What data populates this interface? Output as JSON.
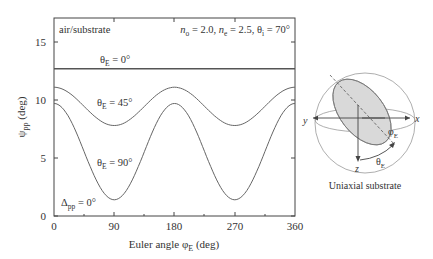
{
  "chart_data": {
    "type": "line",
    "title": "",
    "xlabel": "Euler angle φE (deg)",
    "ylabel": "ψpp (deg)",
    "xlim": [
      0,
      360
    ],
    "ylim": [
      0,
      17
    ],
    "xticks": [
      0,
      90,
      180,
      270,
      360
    ],
    "yticks": [
      0,
      5,
      10,
      15
    ],
    "grid": false,
    "annotations": {
      "medium": "air/substrate",
      "params": "no = 2.0, ne = 2.5, θi = 70°",
      "delta": "Δpp = 0°"
    },
    "x": [
      0,
      45,
      90,
      135,
      180,
      225,
      270,
      315,
      360
    ],
    "series": [
      {
        "name": "θE = 0°",
        "values": [
          12.7,
          12.7,
          12.7,
          12.7,
          12.7,
          12.7,
          12.7,
          12.7,
          12.7
        ]
      },
      {
        "name": "θE = 45°",
        "values": [
          11.1,
          9.5,
          7.8,
          9.5,
          11.1,
          9.5,
          7.8,
          9.5,
          11.1
        ]
      },
      {
        "name": "θE = 90°",
        "values": [
          9.7,
          5.5,
          1.4,
          5.5,
          9.7,
          5.5,
          1.4,
          5.5,
          9.7
        ]
      }
    ]
  },
  "labels": {
    "medium": "air/substrate",
    "n_o": "n",
    "n_o_sub": "o",
    "n_o_val": " = 2.0, ",
    "n_e": "n",
    "n_e_sub": "e",
    "n_e_val": " = 2.5, θ",
    "theta_i_sub": "i",
    "theta_i_val": " = 70°",
    "series0": "θ",
    "series0_sub": "E",
    "series0_val": " = 0°",
    "series1": "θ",
    "series1_sub": "E",
    "series1_val": " = 45°",
    "series2": "θ",
    "series2_sub": "E",
    "series2_val": " = 90°",
    "delta": "Δ",
    "delta_sub": "pp",
    "delta_val": " = 0°",
    "ylabel": "ψ",
    "ylabel_sub": "pp",
    "ylabel_unit": " (deg)",
    "xlabel": "Euler angle φ",
    "xlabel_sub": "E",
    "xlabel_unit": " (deg)",
    "x0": "0",
    "x90": "90",
    "x180": "180",
    "x270": "270",
    "x360": "360",
    "y0": "0",
    "y5": "5",
    "y10": "10",
    "y15": "15"
  },
  "diagram": {
    "caption": "Uniaxial substrate",
    "axis_x": "x",
    "axis_y": "y",
    "axis_z": "z",
    "phi": "φ",
    "phi_sub": "E",
    "theta": "θ",
    "theta_sub": "E"
  }
}
